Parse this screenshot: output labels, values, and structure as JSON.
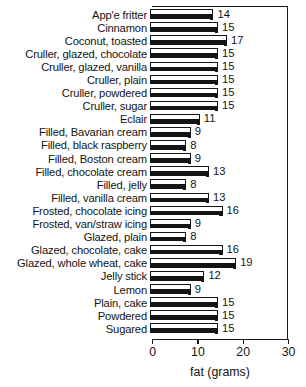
{
  "chart_data": {
    "type": "bar",
    "orientation": "horizontal",
    "title": "",
    "xlabel": "fat (grams)",
    "ylabel": "",
    "xlim": [
      0,
      30
    ],
    "xticks": [
      0,
      10,
      20,
      30
    ],
    "xtick_labels": [
      "0",
      "10",
      "20",
      "30"
    ],
    "grid": false,
    "legend": null,
    "value_labels_shown": true,
    "categories": [
      "App'e fritter",
      "Cinnamon",
      "Coconut, toasted",
      "Cruller, glazed, chocolate",
      "Cruller, glazed, vanilla",
      "Cruller, plain",
      "Cruller, powdered",
      "Cruller, sugar",
      "Eclair",
      "Filled, Bavarian cream",
      "Filled, black raspberry",
      "Filled, Boston cream",
      "Filled, chocolate cream",
      "Filled, jelly",
      "Filled, vanilla cream",
      "Frosted, chocolate icing",
      "Frosted, van/straw icing",
      "Glazed, plain",
      "Glazed, chocolate, cake",
      "Glazed, whole wheat, cake",
      "Jelly stick",
      "Lemon",
      "Plain, cake",
      "Powdered",
      "Sugared"
    ],
    "values": [
      14,
      15,
      17,
      15,
      15,
      15,
      15,
      15,
      11,
      9,
      8,
      9,
      13,
      8,
      13,
      16,
      9,
      8,
      16,
      19,
      12,
      9,
      15,
      15,
      15
    ],
    "value_label_texts": [
      "14",
      "15",
      "17",
      "15",
      "15",
      "15",
      "15",
      "15",
      "11",
      "9",
      "8",
      "9",
      "13",
      "8",
      "13",
      "16",
      "9",
      "8",
      "16",
      "19",
      "12",
      "9",
      "15",
      "15",
      "15"
    ],
    "colors": {
      "bar_face": "#ffffff",
      "bar_shadow": "#141414",
      "bar_outline": "#141414",
      "axis": "#1a1a1a",
      "text": "#141414",
      "background": "#ffffff"
    }
  }
}
